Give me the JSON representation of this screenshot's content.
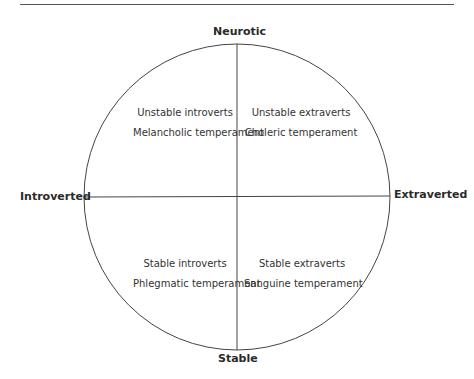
{
  "axes": {
    "top": "Neurotic",
    "bottom": "Stable",
    "left": "Introverted",
    "right": "Extraverted"
  },
  "quadrants": {
    "top_left": {
      "line1": "Unstable introverts",
      "line2": "Melancholic temperament"
    },
    "top_right": {
      "line1": "Unstable extraverts",
      "line2": "Choleric temperament"
    },
    "bottom_left": {
      "line1": "Stable introverts",
      "line2": "Phlegmatic temperament"
    },
    "bottom_right": {
      "line1": "Stable extraverts",
      "line2": "Sanguine temperament"
    }
  },
  "colors": {
    "line": "#444444",
    "text": "#2a2a2a"
  }
}
